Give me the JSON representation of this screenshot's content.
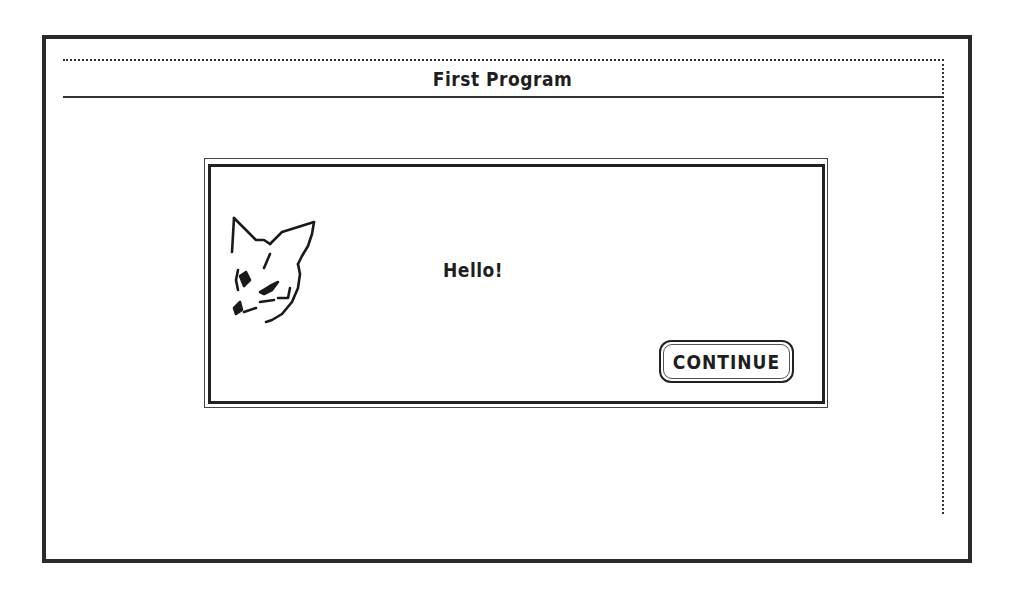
{
  "window": {
    "title": "First Program"
  },
  "dialog": {
    "icon": "fox-icon",
    "message": "Hello!",
    "buttons": [
      {
        "label": "CONTINUE"
      }
    ]
  },
  "colors": {
    "background": "#ffffff",
    "ink": "#1e1e1e"
  }
}
